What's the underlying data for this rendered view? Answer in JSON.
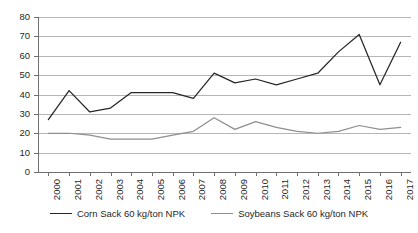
{
  "chart_data": {
    "type": "line",
    "title": "",
    "xlabel": "",
    "ylabel": "",
    "ylim": [
      0,
      80
    ],
    "ytick_step": 10,
    "grid": "horizontal",
    "legend_position": "bottom-center",
    "categories": [
      "2000",
      "2001",
      "2002",
      "2003",
      "2004",
      "2005",
      "2006",
      "2007",
      "2008",
      "2009",
      "2010",
      "2011",
      "2012",
      "2013",
      "2014",
      "2015",
      "2016",
      "2017"
    ],
    "yticks": [
      "0",
      "10",
      "20",
      "30",
      "40",
      "50",
      "60",
      "70",
      "80"
    ],
    "series": [
      {
        "name": "Corn Sack 60 kg/ton NPK",
        "color": "#262626",
        "values": [
          27,
          42,
          31,
          33,
          41,
          41,
          41,
          38,
          51,
          46,
          48,
          45,
          48,
          51,
          62,
          71,
          45,
          67
        ]
      },
      {
        "name": "Soybeans Sack 60 kg/ton NPK",
        "color": "#8f8f8f",
        "values": [
          20,
          20,
          19,
          17,
          17,
          17,
          19,
          21,
          28,
          22,
          26,
          23,
          21,
          20,
          21,
          24,
          22,
          23
        ]
      }
    ]
  },
  "legend": {
    "items": [
      {
        "label": "Corn Sack 60 kg/ton NPK"
      },
      {
        "label": "Soybeans Sack 60 kg/ton NPK"
      }
    ]
  }
}
